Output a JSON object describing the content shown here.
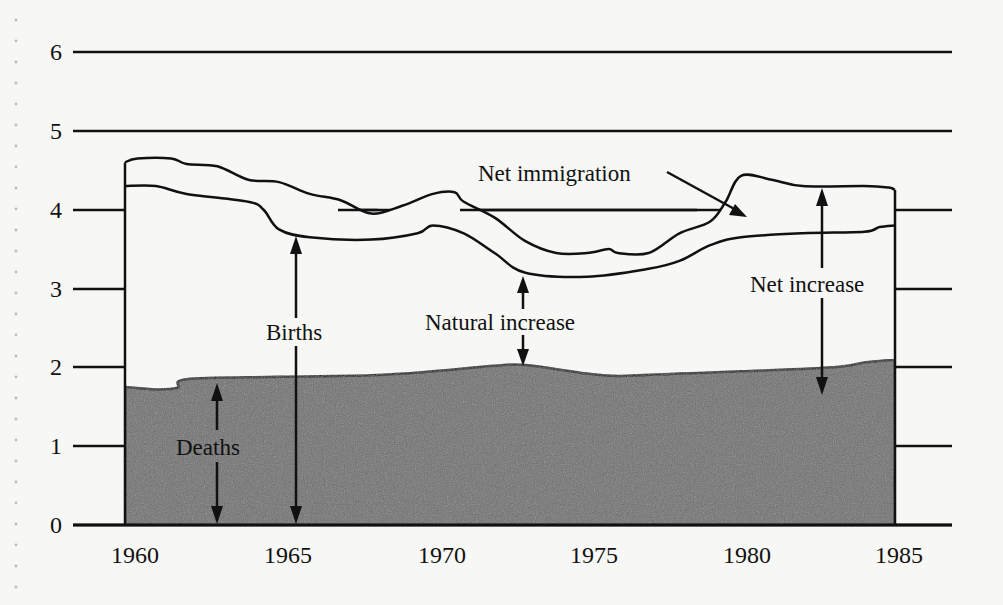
{
  "chart_data": {
    "type": "area",
    "title": "",
    "xlabel": "",
    "ylabel": "",
    "xlim": [
      1960,
      1985
    ],
    "ylim": [
      0,
      6
    ],
    "grid": true,
    "x_ticks": [
      "1960",
      "1965",
      "1970",
      "1975",
      "1980",
      "1985"
    ],
    "y_ticks": [
      "0",
      "1",
      "2",
      "3",
      "4",
      "5",
      "6"
    ],
    "series": [
      {
        "name": "Deaths",
        "filled": true,
        "x": [
          1960,
          1961,
          1961.7,
          1962,
          1965,
          1968,
          1970,
          1972,
          1973,
          1975,
          1976,
          1978,
          1980,
          1983,
          1984,
          1985
        ],
        "values": [
          1.75,
          1.72,
          1.74,
          1.85,
          1.88,
          1.9,
          1.95,
          2.02,
          2.03,
          1.92,
          1.89,
          1.92,
          1.95,
          2.0,
          2.06,
          2.1
        ]
      },
      {
        "name": "Births",
        "x": [
          1960,
          1961,
          1962,
          1964,
          1964.5,
          1965,
          1966,
          1968,
          1969.5,
          1970,
          1971,
          1972,
          1973,
          1975,
          1977,
          1978,
          1979,
          1980,
          1982,
          1984,
          1984.5,
          1985
        ],
        "values": [
          4.3,
          4.3,
          4.2,
          4.1,
          4.0,
          3.75,
          3.65,
          3.62,
          3.7,
          3.8,
          3.7,
          3.45,
          3.2,
          3.15,
          3.25,
          3.35,
          3.55,
          3.65,
          3.7,
          3.72,
          3.78,
          3.8
        ]
      },
      {
        "name": "Total (Births + Net immigration)",
        "x": [
          1960,
          1960.4,
          1961.5,
          1962,
          1963,
          1964,
          1965,
          1966,
          1967,
          1968,
          1969,
          1970,
          1970.7,
          1971,
          1972,
          1973,
          1974,
          1975,
          1975.7,
          1976,
          1977,
          1978,
          1979,
          1979.5,
          1980,
          1981,
          1982,
          1984,
          1984.8,
          1985
        ],
        "values": [
          4.6,
          4.65,
          4.65,
          4.58,
          4.55,
          4.38,
          4.35,
          4.2,
          4.12,
          3.95,
          4.05,
          4.2,
          4.22,
          4.1,
          3.9,
          3.6,
          3.45,
          3.45,
          3.5,
          3.45,
          3.45,
          3.7,
          3.85,
          4.1,
          4.43,
          4.38,
          4.3,
          4.3,
          4.28,
          4.25
        ]
      }
    ],
    "annotations": [
      {
        "text": "Net immigration",
        "points_to": "gap between Births and Total curves, ~1980"
      },
      {
        "text": "Births",
        "arrow_at_year": 1965,
        "spans": [
          0,
          3.75
        ]
      },
      {
        "text": "Natural increase",
        "arrow_at_year": 1973,
        "spans": [
          2.03,
          3.2
        ]
      },
      {
        "text": "Deaths",
        "arrow_at_year": 1963,
        "spans": [
          0,
          1.88
        ]
      },
      {
        "text": "Net increase",
        "arrow_at_year": 1983,
        "spans": [
          2.0,
          4.3
        ]
      }
    ]
  },
  "labels": {
    "y_ticks": [
      "0",
      "1",
      "2",
      "3",
      "4",
      "5",
      "6"
    ],
    "x_ticks": [
      "1960",
      "1965",
      "1970",
      "1975",
      "1980",
      "1985"
    ],
    "net_immigration": "Net immigration",
    "births": "Births",
    "natural_increase": "Natural increase",
    "deaths": "Deaths",
    "net_increase": "Net increase"
  },
  "colors": {
    "background": "#f7f7f5",
    "line": "#111111",
    "deaths_fill": "#6e6e6e"
  }
}
